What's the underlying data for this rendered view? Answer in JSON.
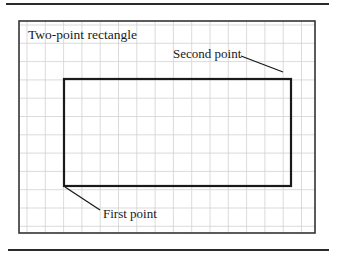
{
  "figure": {
    "title": "Two-point rectangle",
    "labels": {
      "second_point": "Second point",
      "first_point": "First point"
    },
    "frame": {
      "x1": 19,
      "y1": 21,
      "x2": 315,
      "y2": 233
    },
    "grid": {
      "spacing": 18.3,
      "color": "#d0d0d0"
    },
    "rectangle": {
      "first_point": {
        "x": 64,
        "y": 186
      },
      "second_point": {
        "x": 291,
        "y": 79
      }
    },
    "colors": {
      "line": "#1a1a1a",
      "grid": "#d0d0d0",
      "background": "#ffffff"
    }
  }
}
